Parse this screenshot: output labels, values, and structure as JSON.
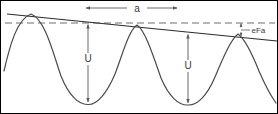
{
  "figure": {
    "labels": {
      "period": "a",
      "barrier_left": "U",
      "barrier_right": "U",
      "field_drop": "eFa"
    },
    "colors": {
      "curve": "#4a4a4a",
      "slope_line": "#2b2b2b",
      "dashed_line": "#6e6e6e",
      "arrow": "#5a5a5a",
      "text": "#3a3a3a",
      "border": "#000000",
      "background": "#ffffff"
    },
    "geometry": {
      "width": 278,
      "height": 114,
      "peaks_x": [
        30,
        136,
        237
      ],
      "troughs_x": [
        87,
        187
      ],
      "peak_y": [
        13,
        24,
        33
      ],
      "trough_y": [
        103,
        104
      ],
      "dashed_line_y": 22,
      "slope_line_start": [
        6,
        13
      ],
      "slope_line_end": [
        276,
        40
      ],
      "period_arrow_y": 7,
      "period_arrow_x1": 85,
      "period_arrow_x2": 176,
      "u_arrow_left_x": 87,
      "u_arrow_right_x": 187,
      "efa_tick_x": 240
    }
  }
}
